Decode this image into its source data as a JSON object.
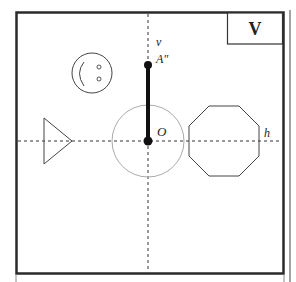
{
  "panel": {
    "label": "V"
  },
  "axes": {
    "vertical_label": "v",
    "horizontal_label": "h"
  },
  "points": {
    "top_point_label": "A″",
    "origin_label": "O"
  },
  "colors": {
    "frame": "#2a2a2a",
    "stroke": "#333333",
    "circle": "#aaaaaa",
    "background": "#ffffff"
  },
  "shapes": [
    {
      "name": "smiley-face",
      "type": "circle-with-face"
    },
    {
      "name": "triangle",
      "type": "triangle"
    },
    {
      "name": "circle-around-origin",
      "type": "circle"
    },
    {
      "name": "octagon",
      "type": "octagon"
    },
    {
      "name": "segment-O-A",
      "type": "thick-line"
    }
  ]
}
